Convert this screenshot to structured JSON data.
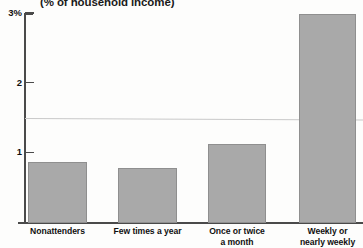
{
  "chart_data": {
    "type": "bar",
    "title": "(% of household income)",
    "xlabel": "",
    "ylabel": "",
    "categories": [
      "Nonattenders",
      "Few times a year",
      "Once or twice\na month",
      "Weekly or\nnearly weekly"
    ],
    "category_lines": [
      [
        "Nonattenders"
      ],
      [
        "Few times a year"
      ],
      [
        "Once or twice",
        "a month"
      ],
      [
        "Weekly or",
        "nearly weekly"
      ]
    ],
    "values": [
      0.88,
      0.79,
      1.14,
      3.0
    ],
    "ylim": [
      0,
      3
    ],
    "yticks": [
      1,
      2,
      3
    ],
    "ytick_labels": [
      "1",
      "2",
      "3%"
    ],
    "gridlines": [
      1.5
    ],
    "grid": true,
    "legend": false,
    "bar_color": "#a9a9a9",
    "bar_border_color": "#8f8f8f",
    "axis_color": "#4a4a4a",
    "grid_color": "#c9c9c9",
    "background_color": "#fdfdfc"
  }
}
